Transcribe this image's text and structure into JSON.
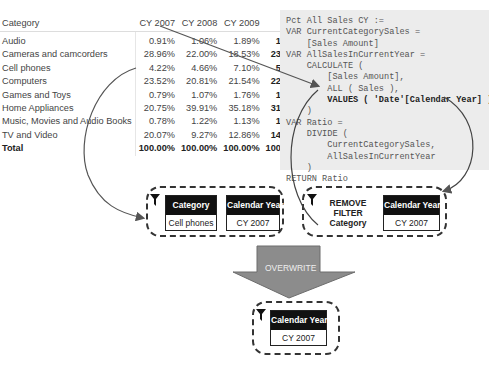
{
  "table": {
    "headers": [
      "Category",
      "CY 2007",
      "CY 2008",
      "CY 2009",
      "Total"
    ],
    "rows": [
      {
        "category": "Audio",
        "cy2007": "0.91%",
        "cy2008": "1.06%",
        "cy2009": "1.89%",
        "total": "1.26%"
      },
      {
        "category": "Cameras and camcorders",
        "cy2007": "28.96%",
        "cy2008": "22.00%",
        "cy2009": "18.53%",
        "total": "23.51%"
      },
      {
        "category": "Cell phones",
        "cy2007": "4.22%",
        "cy2008": "4.66%",
        "cy2009": "7.10%",
        "total": "5.25%"
      },
      {
        "category": "Computers",
        "cy2007": "23.52%",
        "cy2008": "20.81%",
        "cy2009": "21.54%",
        "total": "22.04%"
      },
      {
        "category": "Games and Toys",
        "cy2007": "0.79%",
        "cy2008": "1.07%",
        "cy2009": "1.76%",
        "total": "1.18%"
      },
      {
        "category": "Home Appliances",
        "cy2007": "20.75%",
        "cy2008": "39.91%",
        "cy2009": "35.18%",
        "total": "31.38%"
      },
      {
        "category": "Music, Movies and Audio Books",
        "cy2007": "0.78%",
        "cy2008": "1.22%",
        "cy2009": "1.13%",
        "total": "1.03%"
      },
      {
        "category": "TV and Video",
        "cy2007": "20.07%",
        "cy2008": "9.27%",
        "cy2009": "12.86%",
        "total": "14.36%"
      }
    ],
    "total_row": {
      "category": "Total",
      "cy2007": "100.00%",
      "cy2008": "100.00%",
      "cy2009": "100.00%",
      "total": "100.00%"
    }
  },
  "code": {
    "lines": [
      "Pct All Sales CY :=",
      "VAR CurrentCategorySales =",
      "    [Sales Amount]",
      "VAR AllSalesInCurrentYear =",
      "    CALCULATE (",
      "        [Sales Amount],",
      "        ALL ( Sales ),",
      "        VALUES ( 'Date'[Calendar Year] )",
      "    )",
      "VAR Ratio =",
      "    DIVIDE (",
      "        CurrentCategorySales,",
      "        AllSalesInCurrentYear",
      "    )",
      "RETURN Ratio"
    ],
    "bold_line_index": 7
  },
  "filter_outer": {
    "icon": "filter-funnel-icon",
    "cards": [
      {
        "header": "Category",
        "value": "Cell phones"
      },
      {
        "header": "Calendar Year",
        "value": "CY 2007"
      }
    ]
  },
  "filter_inner": {
    "icon": "filter-funnel-icon",
    "remove_text": [
      "REMOVE",
      "FILTER",
      "Category"
    ],
    "card": {
      "header": "Calendar Year",
      "value": "CY 2007"
    }
  },
  "overwrite_label": "OVERWRITE",
  "filter_result": {
    "icon": "filter-funnel-icon",
    "card": {
      "header": "Calendar Year",
      "value": "CY 2007"
    }
  },
  "colors": {
    "arrow_fill": "#8c8c8c",
    "code_bg": "#ececec",
    "card_header": "#111111"
  }
}
